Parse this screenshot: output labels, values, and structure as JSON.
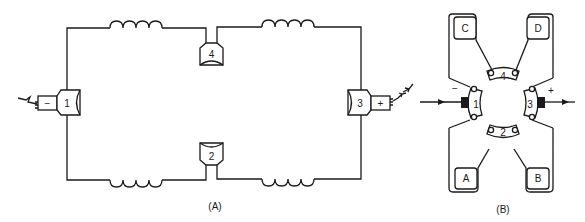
{
  "figure": {
    "panels": [
      {
        "id": "A",
        "caption": "(A)",
        "description": "Schematic of brush/commutator circuit with four coils",
        "brushes": [
          {
            "number": "1",
            "polarity": "−",
            "position": "left"
          },
          {
            "number": "2",
            "position": "bottom"
          },
          {
            "number": "3",
            "polarity": "+",
            "position": "right"
          },
          {
            "number": "4",
            "position": "top"
          }
        ],
        "coils": 4
      },
      {
        "id": "B",
        "caption": "(B)",
        "description": "Physical layout of brushes around commutator with terminals",
        "brushes": [
          {
            "number": "1",
            "polarity": "−"
          },
          {
            "number": "2"
          },
          {
            "number": "3",
            "polarity": "+"
          },
          {
            "number": "4"
          }
        ],
        "terminals": [
          "C",
          "D",
          "A",
          "B"
        ]
      }
    ]
  },
  "labels": {
    "b1": "1",
    "b2": "2",
    "b3": "3",
    "b4": "4",
    "minus": "−",
    "plus": "+",
    "tC": "C",
    "tD": "D",
    "tA": "A",
    "tB": "B",
    "capA": "(A)",
    "capB": "(B)"
  },
  "colors": {
    "ink": "#1a1a1a",
    "background": "#ffffff"
  }
}
